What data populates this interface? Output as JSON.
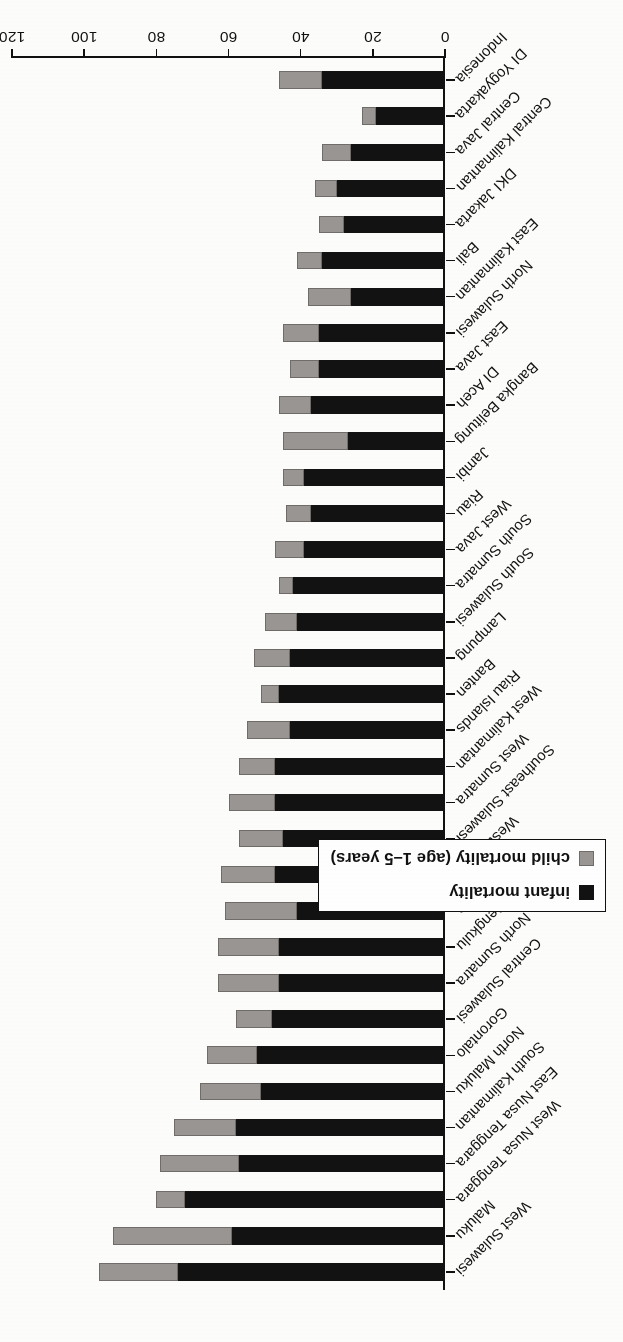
{
  "chart_data": {
    "type": "bar",
    "orientation": "horizontal-stacked",
    "title": "",
    "xlabel": "deaths per 1,000 live births",
    "ylabel": "",
    "xlim": [
      0,
      120
    ],
    "xticks": [
      0,
      20,
      40,
      60,
      80,
      100,
      120
    ],
    "grid": false,
    "legend_position": "bottom-right (rotated page: lower right of figure)",
    "legend": [
      "infant mortality",
      "child mortality (age 1–5 years)"
    ],
    "categories": [
      "Indonesia",
      "DI Yogyakarta",
      "Central Java",
      "Central Kalimantan",
      "DKI Jakarta",
      "Bali",
      "East Kalimantan",
      "North Sulawesi",
      "East Java",
      "DI Aceh",
      "Bangka Belitung",
      "Jambi",
      "Riau",
      "West Java",
      "South Sumatra",
      "South Sulawesi",
      "Lampung",
      "Banten",
      "Riau Islands",
      "West Kalimantan",
      "West Sumatra",
      "Southeast Sulawesi",
      "West Papua",
      "Papua",
      "Bengkulu",
      "North Sumatra",
      "Central Sulawesi",
      "Gorontalo",
      "North Maluku",
      "South Kalimantan",
      "East Nusa Tenggara",
      "West Nusa Tenggara",
      "Maluku",
      "West Sulawesi"
    ],
    "series": [
      {
        "name": "infant mortality",
        "color": "#121212",
        "values": [
          34,
          19,
          26,
          30,
          28,
          34,
          26,
          35,
          35,
          37,
          27,
          39,
          37,
          39,
          42,
          41,
          43,
          46,
          43,
          47,
          47,
          45,
          47,
          41,
          46,
          46,
          48,
          52,
          51,
          58,
          57,
          72,
          59,
          74
        ]
      },
      {
        "name": "child mortality (age 1–5 years)",
        "color": "#999693",
        "values": [
          12,
          4,
          8,
          6,
          7,
          7,
          12,
          10,
          8,
          9,
          18,
          6,
          7,
          8,
          4,
          9,
          10,
          5,
          12,
          10,
          13,
          12,
          15,
          20,
          17,
          17,
          10,
          14,
          17,
          17,
          22,
          8,
          33,
          22
        ]
      }
    ],
    "totals": [
      46,
      23,
      34,
      36,
      35,
      41,
      38,
      45,
      43,
      46,
      45,
      45,
      44,
      47,
      46,
      50,
      53,
      51,
      55,
      57,
      60,
      57,
      62,
      61,
      63,
      63,
      58,
      66,
      68,
      75,
      79,
      80,
      92,
      96
    ]
  },
  "axis": {
    "value_title": "deaths per 1,000 live births",
    "tick_labels": [
      "0",
      "20",
      "40",
      "60",
      "80",
      "100",
      "120"
    ]
  },
  "legend": {
    "items": [
      {
        "label": "infant mortality",
        "swatch": "black-square-icon"
      },
      {
        "label": "child mortality (age 1–5 years)",
        "swatch": "gray-square-icon"
      }
    ]
  }
}
